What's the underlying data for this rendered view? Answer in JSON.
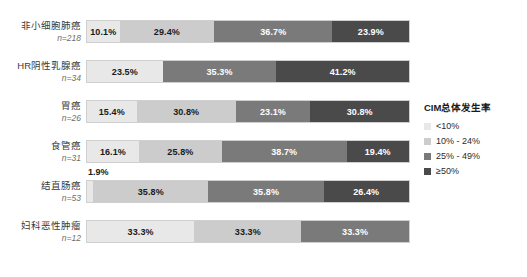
{
  "chart_data": {
    "type": "bar",
    "orientation": "horizontal",
    "stacked": true,
    "stack_mode": "percent",
    "title": "",
    "xlabel": "",
    "ylabel": "",
    "xlim": [
      0,
      100
    ],
    "grid": false,
    "legend": {
      "title": "CIM总体发生率",
      "position": "right",
      "entries": [
        {
          "label": "<10%",
          "color": "#e8e8e8"
        },
        {
          "label": "10% - 24%",
          "color": "#cccccc"
        },
        {
          "label": "25% - 49%",
          "color": "#7a7a7a"
        },
        {
          "label": "≥50%",
          "color": "#4a4a4a"
        }
      ]
    },
    "categories": [
      "非小细胞肺癌",
      "HR阴性乳腺癌",
      "胃癌",
      "食管癌",
      "结直肠癌",
      "妇科恶性肿瘤"
    ],
    "category_counts": [
      "n=218",
      "n=34",
      "n=26",
      "n=31",
      "n=53",
      "n=12"
    ],
    "series": [
      {
        "name": "<10%",
        "values": [
          10.1,
          23.5,
          15.4,
          16.1,
          1.9,
          33.3
        ]
      },
      {
        "name": "10% - 24%",
        "values": [
          29.4,
          0,
          30.8,
          25.8,
          35.8,
          33.3
        ]
      },
      {
        "name": "25% - 49%",
        "values": [
          36.7,
          35.3,
          23.1,
          38.7,
          35.8,
          33.3
        ]
      },
      {
        "name": "≥50%",
        "values": [
          23.9,
          41.2,
          30.8,
          19.4,
          26.4,
          0
        ]
      }
    ],
    "value_labels": [
      [
        "10.1%",
        "29.4%",
        "36.7%",
        "23.9%"
      ],
      [
        "23.5%",
        "",
        "35.3%",
        "41.2%"
      ],
      [
        "15.4%",
        "30.8%",
        "23.1%",
        "30.8%"
      ],
      [
        "16.1%",
        "25.8%",
        "38.7%",
        "19.4%"
      ],
      [
        "1.9%",
        "35.8%",
        "35.8%",
        "26.4%"
      ],
      [
        "33.3%",
        "33.3%",
        "33.3%",
        ""
      ]
    ],
    "callouts": [
      {
        "row": 4,
        "text": "1.9%"
      }
    ]
  }
}
